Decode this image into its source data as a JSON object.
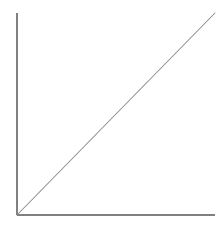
{
  "chart_data": {
    "type": "line",
    "title": "",
    "subtitle": "",
    "xlabel": "",
    "ylabel": "",
    "series": [
      {
        "name": "linear",
        "x": [
          0,
          100
        ],
        "values": [
          0,
          100
        ]
      }
    ],
    "xlim": [
      0,
      100
    ],
    "ylim": [
      0,
      100
    ],
    "xticks": [],
    "yticks": [],
    "xticklabels": [],
    "yticklabels": [],
    "grid": false,
    "legend": false,
    "legend_position": "none",
    "annotations": [],
    "line_color": "#8a8a8a",
    "axis_color": "#808080",
    "background_color": "#ffffff"
  },
  "figure": {
    "width": 223,
    "height": 225,
    "origin_px": [
      17,
      215
    ],
    "x_axis_end_px": [
      215,
      215
    ],
    "y_axis_end_px": [
      17,
      13
    ],
    "series_end_px": [
      215,
      13
    ]
  },
  "accessibility": {
    "chart_description": "Line chart with a single straight diagonal line rising from the origin to the upper right",
    "x_axis_name": "x-axis",
    "y_axis_name": "y-axis",
    "series_name": "linear series"
  }
}
